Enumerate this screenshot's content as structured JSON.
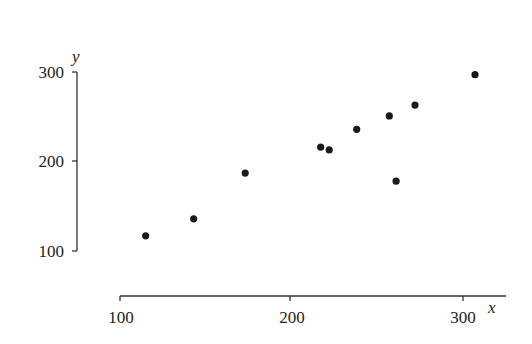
{
  "chart_data": {
    "type": "scatter",
    "title": "",
    "xlabel": "x",
    "ylabel": "y",
    "xlim": [
      100,
      310
    ],
    "ylim": [
      100,
      300
    ],
    "xticks": [
      100,
      200,
      300
    ],
    "yticks": [
      100,
      200,
      300
    ],
    "xtick_labels": [
      "100",
      "200",
      "300"
    ],
    "ytick_labels": [
      "100",
      "200",
      "300"
    ],
    "grid": false,
    "legend": null,
    "series": [
      {
        "name": "data",
        "points": [
          {
            "x": 115,
            "y": 117
          },
          {
            "x": 143,
            "y": 136
          },
          {
            "x": 173,
            "y": 187
          },
          {
            "x": 217,
            "y": 216
          },
          {
            "x": 222,
            "y": 213
          },
          {
            "x": 238,
            "y": 236
          },
          {
            "x": 257,
            "y": 251
          },
          {
            "x": 261,
            "y": 178
          },
          {
            "x": 272,
            "y": 263
          },
          {
            "x": 307,
            "y": 297
          }
        ]
      }
    ]
  },
  "axes": {
    "x_label": "x",
    "y_label": "y",
    "x_ticks": [
      "100",
      "200",
      "300"
    ],
    "y_ticks": [
      "100",
      "200",
      "300"
    ]
  },
  "colors": {
    "marker": "#1a1a1a",
    "axis": "#333333"
  }
}
